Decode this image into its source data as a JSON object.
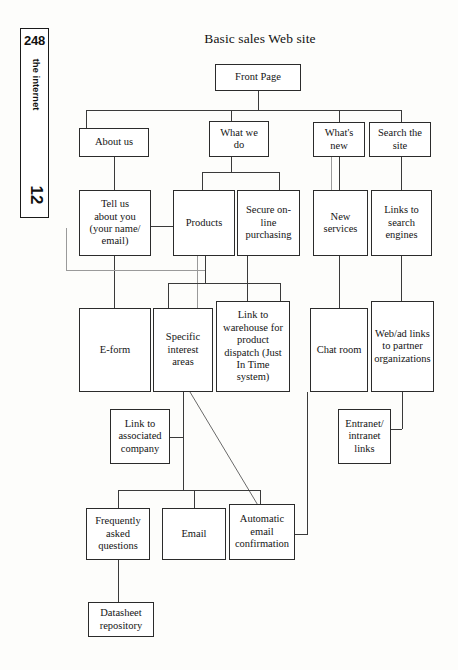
{
  "page": {
    "number": "248",
    "section_label": "the internet",
    "chapter_number": "12"
  },
  "diagram": {
    "title": "Basic sales Web site",
    "type": "flowchart",
    "nodes": [
      {
        "id": "front-page",
        "label": "Front Page"
      },
      {
        "id": "about-us",
        "label": "About us"
      },
      {
        "id": "what-we-do",
        "label": "What we\ndo"
      },
      {
        "id": "whats-new",
        "label": "What's\nnew"
      },
      {
        "id": "search-the-site",
        "label": "Search the\nsite"
      },
      {
        "id": "tell-us-about-you",
        "label": "Tell us\nabout you\n(your name/\nemail)"
      },
      {
        "id": "products",
        "label": "Products"
      },
      {
        "id": "secure-online-purchasing",
        "label": "Secure on-\nline\npurchasing"
      },
      {
        "id": "new-services",
        "label": "New\nservices"
      },
      {
        "id": "links-to-search-engines",
        "label": "Links to\nsearch\nengines"
      },
      {
        "id": "e-form",
        "label": "E-form"
      },
      {
        "id": "specific-interest-areas",
        "label": "Specific\ninterest\nareas"
      },
      {
        "id": "link-to-warehouse",
        "label": "Link to\nwarehouse for\nproduct\ndispatch (Just\nIn Time\nsystem)"
      },
      {
        "id": "chat-room",
        "label": "Chat room"
      },
      {
        "id": "web-ad-links",
        "label": "Web/ad links\nto partner\norganizations"
      },
      {
        "id": "link-to-associated-company",
        "label": "Link to\nassociated\ncompany"
      },
      {
        "id": "entranet-intranet-links",
        "label": "Entranet/\nintranet\nlinks"
      },
      {
        "id": "frequently-asked-questions",
        "label": "Frequently\nasked\nquestions"
      },
      {
        "id": "email",
        "label": "Email"
      },
      {
        "id": "automatic-email-confirmation",
        "label": "Automatic\nemail\nconfirmation"
      },
      {
        "id": "datasheet-repository",
        "label": "Datasheet\nrepository"
      }
    ],
    "edges": [
      {
        "from": "front-page",
        "to": "about-us"
      },
      {
        "from": "front-page",
        "to": "what-we-do"
      },
      {
        "from": "front-page",
        "to": "whats-new"
      },
      {
        "from": "front-page",
        "to": "search-the-site"
      },
      {
        "from": "about-us",
        "to": "tell-us-about-you"
      },
      {
        "from": "what-we-do",
        "to": "products"
      },
      {
        "from": "what-we-do",
        "to": "secure-online-purchasing"
      },
      {
        "from": "whats-new",
        "to": "new-services"
      },
      {
        "from": "search-the-site",
        "to": "links-to-search-engines"
      },
      {
        "from": "tell-us-about-you",
        "to": "products"
      },
      {
        "from": "tell-us-about-you",
        "to": "e-form"
      },
      {
        "from": "tell-us-about-you",
        "to": "products"
      },
      {
        "from": "products",
        "to": "specific-interest-areas"
      },
      {
        "from": "products",
        "to": "link-to-warehouse"
      },
      {
        "from": "secure-online-purchasing",
        "to": "link-to-warehouse"
      },
      {
        "from": "new-services",
        "to": "chat-room"
      },
      {
        "from": "links-to-search-engines",
        "to": "web-ad-links"
      },
      {
        "from": "specific-interest-areas",
        "to": "link-to-associated-company"
      },
      {
        "from": "specific-interest-areas",
        "to": "automatic-email-confirmation"
      },
      {
        "from": "specific-interest-areas",
        "to": "frequently-asked-questions"
      },
      {
        "from": "specific-interest-areas",
        "to": "email"
      },
      {
        "from": "web-ad-links",
        "to": "entranet-intranet-links"
      },
      {
        "from": "link-to-warehouse",
        "to": "automatic-email-confirmation"
      },
      {
        "from": "frequently-asked-questions",
        "to": "datasheet-repository"
      }
    ]
  },
  "colors": {
    "page_background": "#fdfdfb",
    "box_border": "#2b2b2b",
    "line": "#3a3a3a",
    "text": "#141414"
  }
}
